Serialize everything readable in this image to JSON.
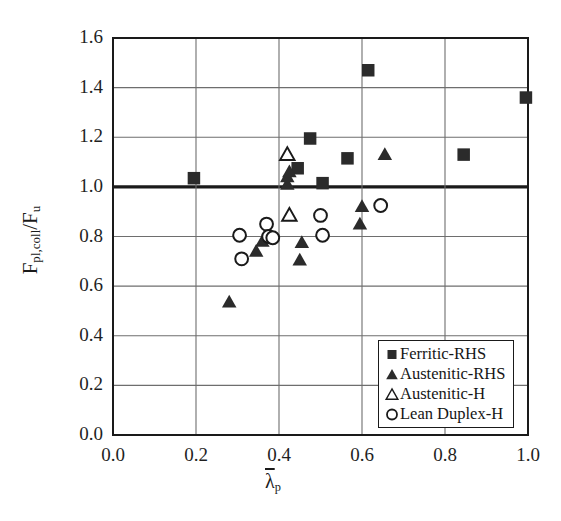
{
  "chart_data": {
    "type": "scatter",
    "title": "",
    "xlabel": "λ̄p",
    "ylabel": "Fpl,coll/Fu",
    "xlim": [
      0.0,
      1.0
    ],
    "ylim": [
      0.0,
      1.6
    ],
    "xticks": [
      "0.0",
      "0.2",
      "0.4",
      "0.6",
      "0.8",
      "1.0"
    ],
    "yticks": [
      "0.0",
      "0.2",
      "0.4",
      "0.6",
      "0.8",
      "1.0",
      "1.2",
      "1.4",
      "1.6"
    ],
    "grid": true,
    "reference_line": {
      "axis": "y",
      "value": 1.0,
      "style": "thick-solid",
      "color": "#1a1a1a"
    },
    "legend_position": "bottom-right",
    "series": [
      {
        "name": "Ferritic-RHS",
        "marker": "filled-square",
        "color": "#2b2b2b",
        "points": [
          {
            "x": 0.195,
            "y": 1.035
          },
          {
            "x": 0.445,
            "y": 1.075
          },
          {
            "x": 0.475,
            "y": 1.195
          },
          {
            "x": 0.505,
            "y": 1.015
          },
          {
            "x": 0.565,
            "y": 1.115
          },
          {
            "x": 0.615,
            "y": 1.47
          },
          {
            "x": 0.845,
            "y": 1.13
          },
          {
            "x": 0.995,
            "y": 1.36
          }
        ]
      },
      {
        "name": "Austenitic-RHS",
        "marker": "filled-triangle",
        "color": "#2b2b2b",
        "points": [
          {
            "x": 0.28,
            "y": 0.535
          },
          {
            "x": 0.345,
            "y": 0.74
          },
          {
            "x": 0.36,
            "y": 0.78
          },
          {
            "x": 0.37,
            "y": 0.795
          },
          {
            "x": 0.42,
            "y": 1.01
          },
          {
            "x": 0.42,
            "y": 1.04
          },
          {
            "x": 0.425,
            "y": 1.06
          },
          {
            "x": 0.45,
            "y": 0.705
          },
          {
            "x": 0.455,
            "y": 0.775
          },
          {
            "x": 0.595,
            "y": 0.85
          },
          {
            "x": 0.6,
            "y": 0.92
          },
          {
            "x": 0.655,
            "y": 1.13
          }
        ]
      },
      {
        "name": "Austenitic-H",
        "marker": "open-triangle",
        "color": "#1a1a1a",
        "points": [
          {
            "x": 0.42,
            "y": 1.13
          },
          {
            "x": 0.425,
            "y": 0.885
          }
        ]
      },
      {
        "name": "Lean Duplex-H",
        "marker": "open-circle",
        "color": "#1a1a1a",
        "points": [
          {
            "x": 0.305,
            "y": 0.805
          },
          {
            "x": 0.31,
            "y": 0.71
          },
          {
            "x": 0.37,
            "y": 0.85
          },
          {
            "x": 0.375,
            "y": 0.8
          },
          {
            "x": 0.385,
            "y": 0.795
          },
          {
            "x": 0.5,
            "y": 0.885
          },
          {
            "x": 0.505,
            "y": 0.805
          },
          {
            "x": 0.645,
            "y": 0.925
          }
        ]
      }
    ]
  },
  "legend": {
    "items": [
      {
        "label": "Ferritic-RHS",
        "marker": "filled-square"
      },
      {
        "label": "Austenitic-RHS",
        "marker": "filled-triangle"
      },
      {
        "label": "Austenitic-H",
        "marker": "open-triangle"
      },
      {
        "label": "Lean Duplex-H",
        "marker": "open-circle"
      }
    ]
  }
}
